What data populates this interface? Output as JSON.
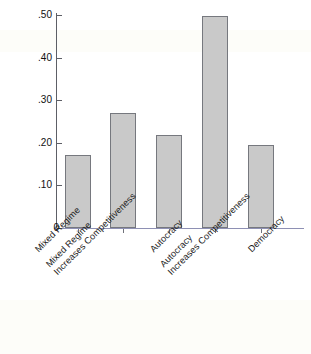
{
  "chart_data": {
    "type": "bar",
    "title": "",
    "xlabel": "",
    "ylabel": "Probability of Interstate War",
    "ylim": [
      0,
      0.5
    ],
    "grid": false,
    "legend": null,
    "ytick_labels": [
      ".50",
      ".40",
      ".30",
      ".20",
      ".10",
      "0"
    ],
    "ytick_values": [
      0.5,
      0.4,
      0.3,
      0.2,
      0.1,
      0
    ],
    "categories": [
      "Mixed Regime",
      "Mixed Regime Increases Competitiveness",
      "Autocracy",
      "Autocracy Increases Competitiveness",
      "Democracy"
    ],
    "category_lines": [
      [
        "Mixed Regime"
      ],
      [
        "Mixed Regime",
        "Increases Competitiveness"
      ],
      [
        "Autocracy"
      ],
      [
        "Autocracy",
        "Increases Competitiveness"
      ],
      [
        "Democracy"
      ]
    ],
    "values": [
      0.171,
      0.271,
      0.218,
      0.498,
      0.196
    ],
    "bar_color": "#c9c9c9",
    "bar_edge_color": "#76787e",
    "axis_color": "#5d5f66",
    "baseline_color": "#8e90b4"
  },
  "labels": {
    "y_axis_title": "Probability of Interstate War",
    "ytick_0": ".50",
    "ytick_1": ".40",
    "ytick_2": ".30",
    "ytick_3": ".20",
    "ytick_4": ".10",
    "ytick_5": "0",
    "cat_0_l1": "Mixed Regime",
    "cat_1_l1": "Mixed Regime",
    "cat_1_l2": "Increases Competitiveness",
    "cat_2_l1": "Autocracy",
    "cat_3_l1": "Autocracy",
    "cat_3_l2": "Increases Competitiveness",
    "cat_4_l1": "Democracy"
  }
}
